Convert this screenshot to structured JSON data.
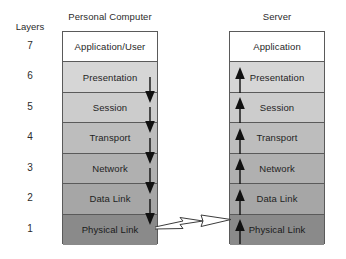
{
  "diagram": {
    "layers_heading": "Layers",
    "layer_numbers": [
      "7",
      "6",
      "5",
      "4",
      "3",
      "2",
      "1"
    ],
    "columns": [
      {
        "id": "personal-computer",
        "title": "Personal Computer",
        "flow_direction": "down",
        "layers": [
          {
            "number": "7",
            "label": "Application/User",
            "fill": "#ffffff"
          },
          {
            "number": "6",
            "label": "Presentation",
            "fill": "#d6d6d6"
          },
          {
            "number": "5",
            "label": "Session",
            "fill": "#cccccc"
          },
          {
            "number": "4",
            "label": "Transport",
            "fill": "#bdbdbd"
          },
          {
            "number": "3",
            "label": "Network",
            "fill": "#b0b0b0"
          },
          {
            "number": "2",
            "label": "Data Link",
            "fill": "#a6a6a6"
          },
          {
            "number": "1",
            "label": "Physical Link",
            "fill": "#8a8a8a"
          }
        ]
      },
      {
        "id": "server",
        "title": "Server",
        "flow_direction": "up",
        "layers": [
          {
            "number": "7",
            "label": "Application",
            "fill": "#ffffff"
          },
          {
            "number": "6",
            "label": "Presentation",
            "fill": "#d6d6d6"
          },
          {
            "number": "5",
            "label": "Session",
            "fill": "#cccccc"
          },
          {
            "number": "4",
            "label": "Transport",
            "fill": "#bdbdbd"
          },
          {
            "number": "3",
            "label": "Network",
            "fill": "#b0b0b0"
          },
          {
            "number": "2",
            "label": "Data Link",
            "fill": "#a6a6a6"
          },
          {
            "number": "1",
            "label": "Physical Link",
            "fill": "#8a8a8a"
          }
        ]
      }
    ],
    "connector": {
      "name": "physical-link-connector",
      "from": "personal-computer.physical-link",
      "to": "server.physical-link",
      "direction": "right",
      "style": "outlined"
    },
    "colors": {
      "stroke": "#5a5a5a",
      "text": "#1f1f1f",
      "arrow": "#111111",
      "background": "#ffffff"
    }
  }
}
